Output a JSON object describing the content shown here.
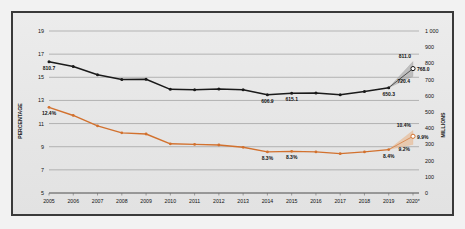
{
  "chart_data": {
    "type": "line",
    "title": "",
    "subtitle": "",
    "xlabel": "",
    "ylabel": "PERCENTAGE",
    "y2label": "MILLIONS",
    "grid": true,
    "legend_position": "none",
    "x": [
      "2005",
      "2006",
      "2007",
      "2008",
      "2009",
      "2010",
      "2011",
      "2012",
      "2013",
      "2014",
      "2015",
      "2016",
      "2017",
      "2018",
      "2019",
      "2020*"
    ],
    "xtick_labels": [
      "2005",
      "2006",
      "2007",
      "2008",
      "2009",
      "2010",
      "2011",
      "2012",
      "2013",
      "2014",
      "2015",
      "2016",
      "2017",
      "2018",
      "2019",
      "2020*"
    ],
    "ylim": [
      5,
      19
    ],
    "ytick_labels": [
      "19",
      "17",
      "15",
      "13",
      "11",
      "9",
      "7",
      "5"
    ],
    "ytick_values": [
      19,
      17,
      15,
      13,
      11,
      9,
      7,
      5
    ],
    "y2lim": [
      0,
      1000
    ],
    "y2tick_labels": [
      "1 000",
      "900",
      "800",
      "700",
      "600",
      "500",
      "400",
      "300",
      "200",
      "100",
      "0"
    ],
    "y2tick_values": [
      1000,
      900,
      800,
      700,
      600,
      500,
      400,
      300,
      200,
      100,
      0
    ],
    "series": [
      {
        "name": "Number of undernourished (millions)",
        "axis": "right",
        "color": "#1a1a1a",
        "marker": "circle-filled",
        "values": [
          810.7,
          781.0,
          730.0,
          700.0,
          702.0,
          640.0,
          637.0,
          642.0,
          637.0,
          606.9,
          615.1,
          618.0,
          607.0,
          627.0,
          650.3,
          768.0
        ],
        "point_labels": [
          {
            "x": "2005",
            "value": 810.7,
            "text": "810.7"
          },
          {
            "x": "2014",
            "value": 606.9,
            "text": "606.9"
          },
          {
            "x": "2015",
            "value": 615.1,
            "text": "615.1"
          },
          {
            "x": "2019",
            "value": 650.3,
            "text": "650.3"
          },
          {
            "x": "2020*",
            "value": 768.0,
            "text": "768.0"
          }
        ],
        "projection": {
          "from_x": "2019",
          "to_x": "2020*",
          "from_value": 650.3,
          "central": 768.0,
          "upper": 811.0,
          "lower": 720.4,
          "upper_label": "811.0",
          "central_label": "768.0",
          "lower_label": "720.4",
          "band_color": "#9b9b9b"
        }
      },
      {
        "name": "Prevalence of undernourishment (percentage)",
        "axis": "left",
        "color": "#d2712e",
        "marker": "circle-filled",
        "values": [
          12.4,
          11.7,
          10.8,
          10.2,
          10.1,
          9.25,
          9.2,
          9.15,
          8.95,
          8.55,
          8.6,
          8.55,
          8.4,
          8.55,
          8.75,
          9.9
        ],
        "point_labels": [
          {
            "x": "2005",
            "value": 12.4,
            "text": "12.4%"
          },
          {
            "x": "2014",
            "value": 8.55,
            "text": "8.3%"
          },
          {
            "x": "2015",
            "value": 8.6,
            "text": "8.3%"
          },
          {
            "x": "2019",
            "value": 8.75,
            "text": "8.4%"
          },
          {
            "x": "2020*",
            "value": 9.9,
            "text": "9.9%"
          }
        ],
        "projection": {
          "from_x": "2019",
          "to_x": "2020*",
          "from_value": 8.75,
          "central": 9.9,
          "upper": 10.4,
          "lower": 9.2,
          "upper_label": "10.4%",
          "central_label": "9.9%",
          "lower_label": "9.2%",
          "band_color": "#e8b68c"
        }
      }
    ]
  },
  "axes": {
    "left_title": "PERCENTAGE",
    "right_title": "MILLIONS"
  },
  "colors": {
    "black_series": "#1a1a1a",
    "orange_series": "#d2712e",
    "grid": "#9b9b9b",
    "frame": "#3a3a3a",
    "background": "#e9e9e9"
  }
}
